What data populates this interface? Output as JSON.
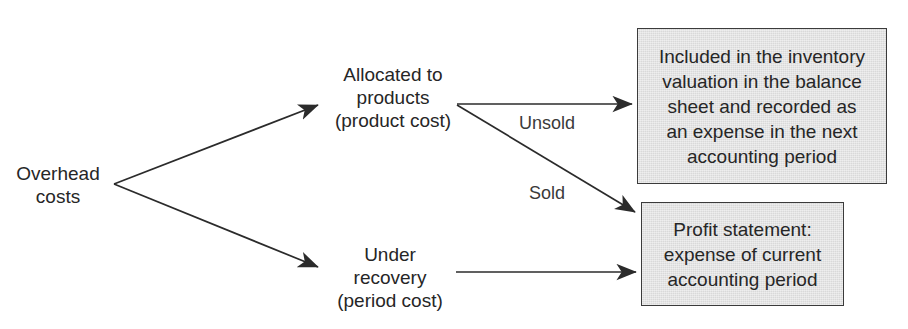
{
  "diagram": {
    "type": "flowchart",
    "background_color": "#ffffff",
    "box_fill_color": "#d9d9d9",
    "box_border_color": "#3b3b3b",
    "text_color": "#262626",
    "edge_label_color": "#3a3a3a",
    "nodes": {
      "source": {
        "name": "overhead-costs",
        "text": "Overhead\ncosts"
      },
      "allocated": {
        "name": "allocated-to-products",
        "text": "Allocated to\nproducts\n(product cost)"
      },
      "under_recovery": {
        "name": "under-recovery",
        "text": "Under\nrecovery\n(period cost)"
      },
      "inventory_box": {
        "name": "inventory-valuation-box",
        "text": "Included in the inventory\nvaluation in the balance\nsheet and recorded as\nan expense in the next\naccounting period"
      },
      "profit_box": {
        "name": "profit-statement-box",
        "text": "Profit statement:\nexpense of current\naccounting period"
      }
    },
    "edge_labels": {
      "unsold": "Unsold",
      "sold": "Sold"
    },
    "edges": [
      {
        "from": "overhead-costs",
        "to": "allocated-to-products",
        "label": ""
      },
      {
        "from": "overhead-costs",
        "to": "under-recovery",
        "label": ""
      },
      {
        "from": "allocated-to-products",
        "to": "inventory-valuation-box",
        "label": "Unsold"
      },
      {
        "from": "allocated-to-products",
        "to": "profit-statement-box",
        "label": "Sold"
      },
      {
        "from": "under-recovery",
        "to": "profit-statement-box",
        "label": ""
      }
    ]
  }
}
